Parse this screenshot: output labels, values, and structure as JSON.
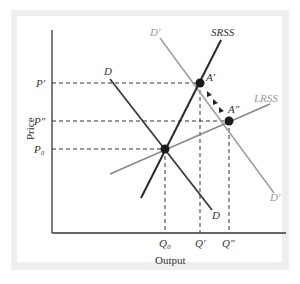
{
  "diagram": {
    "type": "economics-supply-demand",
    "axes": {
      "x_label": "Output",
      "y_label": "Price"
    },
    "price_ticks": [
      {
        "id": "p_prime",
        "label": "P′"
      },
      {
        "id": "p_double_prime",
        "label": "P″"
      },
      {
        "id": "p0",
        "label": "P₀"
      }
    ],
    "quantity_ticks": [
      {
        "id": "q0",
        "label": "Q₀"
      },
      {
        "id": "q_prime",
        "label": "Q′"
      },
      {
        "id": "q_double_prime",
        "label": "Q″"
      }
    ],
    "curves": [
      {
        "id": "demand",
        "label": "D",
        "label_end": "D",
        "color": "#3a3a3a"
      },
      {
        "id": "demand_shifted",
        "label": "D′",
        "label_end": "D′",
        "color": "#9a9a9a"
      },
      {
        "id": "srss",
        "label": "SRSS",
        "color": "#2a2a2a"
      },
      {
        "id": "lrss",
        "label": "LRSS",
        "color": "#8a8a8a"
      }
    ],
    "points": [
      {
        "id": "a_prime",
        "label": "A′"
      },
      {
        "id": "a_double_prime",
        "label": "A″"
      },
      {
        "id": "e0",
        "label": ""
      }
    ],
    "colors": {
      "frame": "#eceef0",
      "dark_line": "#2f2f2f",
      "gray_line": "#999999"
    }
  }
}
